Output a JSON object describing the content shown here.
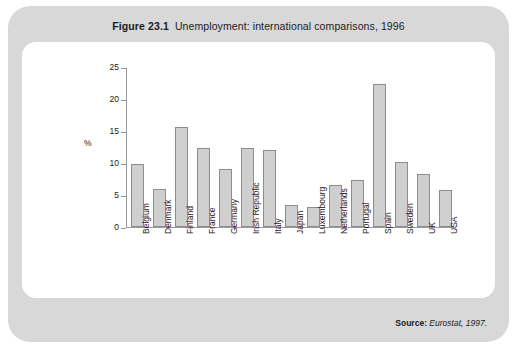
{
  "figure": {
    "number": "Figure 23.1",
    "caption": "Unemployment: international comparisons, 1996"
  },
  "source": {
    "label": "Source:",
    "value": "Eurostat, 1997."
  },
  "chart_data": {
    "type": "bar",
    "xlabel": "",
    "ylabel": "%",
    "ylim": [
      0,
      25
    ],
    "yticks": [
      0,
      5,
      10,
      15,
      20,
      25
    ],
    "ytick_labels": [
      "0",
      "5",
      "10",
      "15",
      "20",
      "25"
    ],
    "grid": false,
    "legend": false,
    "categories": [
      "Belgium",
      "Denmark",
      "Finland",
      "France",
      "Germany",
      "Irish Republic",
      "Italy",
      "Japan",
      "Luxembourg",
      "Netherlands",
      "Portugal",
      "Spain",
      "Sweden",
      "UK",
      "USA"
    ],
    "values": [
      9.8,
      5.9,
      15.7,
      12.4,
      9.0,
      12.3,
      12.0,
      3.4,
      3.2,
      6.5,
      7.3,
      22.4,
      10.1,
      8.3,
      5.8
    ],
    "bar_fill": "#cfcfcf",
    "bar_border": "#8d8d8d"
  }
}
